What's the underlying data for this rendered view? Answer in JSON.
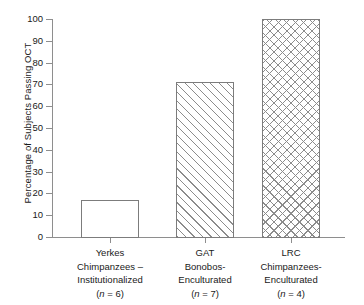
{
  "chart_data": {
    "type": "bar",
    "title": "",
    "xlabel": "",
    "ylabel": "Percentage of Subjects Passing OCT",
    "ylim": [
      0,
      100
    ],
    "yticks": [
      "0",
      "10",
      "20",
      "30",
      "40",
      "50",
      "60",
      "70",
      "80",
      "90",
      "100"
    ],
    "grid": false,
    "legend": "none",
    "categories": [
      "Yerkes Chimpanzees – Institutionalized (n = 6)",
      "GAT Bonobos-Enculturated (n = 7)",
      "LRC Chimpanzees-Enculturated (n = 4)"
    ],
    "values": [
      17,
      71,
      100
    ],
    "bars": [
      {
        "name": "yerkes-chimpanzees",
        "value": 17,
        "fill": "plain",
        "label_lines": [
          "Yerkes",
          "Chimpanzees –",
          "Institutionalized"
        ],
        "n_label": "(n = 6)",
        "n_italic": "n",
        "n_value": "= 6)",
        "n_open": "("
      },
      {
        "name": "gat-bonobos",
        "value": 71,
        "fill": "diagonal-hatch",
        "label_lines": [
          "GAT",
          "Bonobos-",
          "Enculturated"
        ],
        "n_label": "(n = 7)",
        "n_italic": "n",
        "n_value": "= 7)",
        "n_open": "("
      },
      {
        "name": "lrc-chimpanzees",
        "value": 100,
        "fill": "cross-hatch",
        "label_lines": [
          "LRC",
          "Chimpanzees-",
          "Enculturated"
        ],
        "n_label": "(n = 4)",
        "n_italic": "n",
        "n_value": "= 4)",
        "n_open": "("
      }
    ],
    "colors": {
      "axis": "#8e8e8e",
      "bar_border": "#7c7c7c",
      "hatch": "#8c8c8c",
      "bar_fill": "#ffffff",
      "text": "#1a1a1a",
      "background": "#ffffff"
    }
  }
}
